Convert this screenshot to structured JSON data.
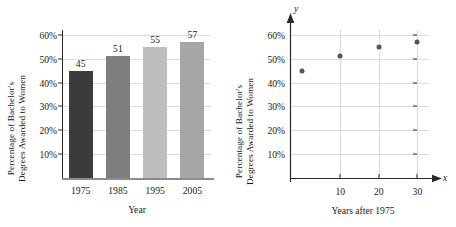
{
  "chart_data": [
    {
      "type": "bar",
      "title": "",
      "xlabel": "Year",
      "ylabel_line1": "Percentage of Bachelor's",
      "ylabel_line2": "Degrees Awarded to Women",
      "categories": [
        "1975",
        "1985",
        "1995",
        "2005"
      ],
      "values": [
        45,
        51,
        55,
        57
      ],
      "value_labels": [
        "45",
        "51",
        "55",
        "57"
      ],
      "bar_colors": [
        "#3b3b3b",
        "#7e7e7e",
        "#bdbdbd",
        "#a6a6a6"
      ],
      "ylim": [
        0,
        62
      ],
      "yticks": [
        10,
        20,
        30,
        40,
        50,
        60
      ],
      "ytick_labels": [
        "10%",
        "20%",
        "30%",
        "40%",
        "50%",
        "60%"
      ],
      "grid": true,
      "legend": "none"
    },
    {
      "type": "scatter",
      "title": "",
      "xlabel": "Years after 1975",
      "ylabel_line1": "Percentage of Bachelor's",
      "ylabel_line2": "Degrees Awarded to Women",
      "x_axis_name": "x",
      "y_axis_name": "y",
      "x": [
        0,
        10,
        20,
        30
      ],
      "y": [
        45,
        51,
        55,
        57
      ],
      "point_color": "#555555",
      "xlim": [
        -3,
        33
      ],
      "ylim": [
        0,
        62
      ],
      "xticks": [
        10,
        20,
        30
      ],
      "xtick_labels": [
        "10",
        "20",
        "30"
      ],
      "yticks": [
        10,
        20,
        30,
        40,
        50,
        60
      ],
      "ytick_labels": [
        "10%",
        "20%",
        "30%",
        "40%",
        "50%",
        "60%"
      ],
      "grid": true,
      "legend": "none"
    }
  ]
}
